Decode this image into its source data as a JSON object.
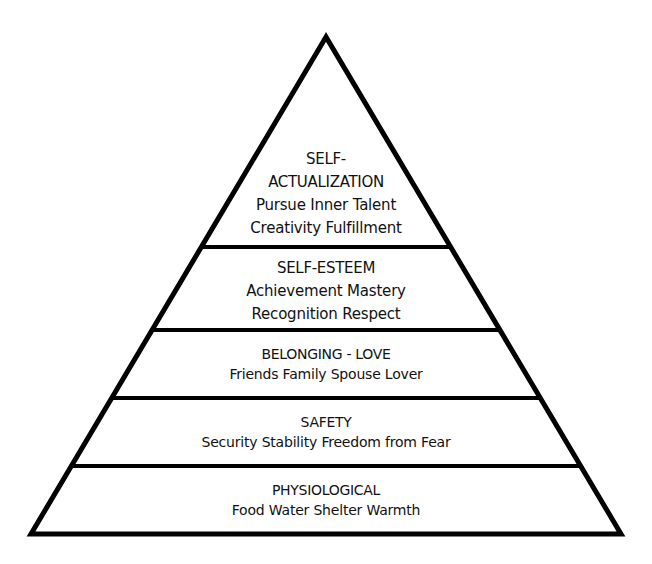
{
  "diagram": {
    "type": "pyramid",
    "colors": {
      "stroke": "#000000",
      "fill": "#ffffff",
      "text": "#111111"
    },
    "geometry": {
      "apex": [
        326,
        35
      ],
      "base_left": [
        30,
        535
      ],
      "base_right": [
        621,
        535
      ],
      "dividers_y": [
        247,
        330,
        398,
        466
      ]
    },
    "tiers": [
      {
        "id": "self-actualization",
        "title_lines": [
          "SELF-",
          "ACTUALIZATION"
        ],
        "items_lines": [
          "Pursue Inner Talent",
          "Creativity  Fulfillment"
        ]
      },
      {
        "id": "self-esteem",
        "title_lines": [
          "SELF-ESTEEM"
        ],
        "items_lines": [
          "Achievement Mastery",
          "Recognition  Respect"
        ]
      },
      {
        "id": "belonging-love",
        "title_lines": [
          "BELONGING - LOVE"
        ],
        "items_lines": [
          "Friends  Family  Spouse  Lover"
        ]
      },
      {
        "id": "safety",
        "title_lines": [
          "SAFETY"
        ],
        "items_lines": [
          "Security  Stability  Freedom from Fear"
        ]
      },
      {
        "id": "physiological",
        "title_lines": [
          "PHYSIOLOGICAL"
        ],
        "items_lines": [
          "Food  Water  Shelter  Warmth"
        ]
      }
    ]
  }
}
